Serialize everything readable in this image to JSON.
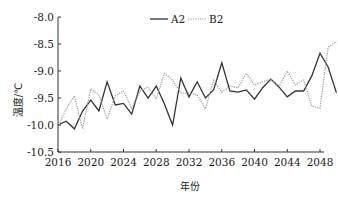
{
  "chart_data": {
    "type": "line",
    "title": "",
    "xlabel": "年份",
    "ylabel": "温度/℃",
    "ylim": [
      -10.5,
      -8.0
    ],
    "xlim": [
      2016,
      2050
    ],
    "yticks": [
      -10.5,
      -10.0,
      -9.5,
      -9.0,
      -8.5,
      -8.0
    ],
    "ytick_labels": [
      "-10.5",
      "-10.0",
      "-9.5",
      "-9.0",
      "-8.5",
      "-8.0"
    ],
    "xticks": [
      2016,
      2020,
      2024,
      2028,
      2032,
      2036,
      2040,
      2044,
      2048
    ],
    "xtick_labels": [
      "2016",
      "2020",
      "2024",
      "2028",
      "2032",
      "2036",
      "2040",
      "2044",
      "2048"
    ],
    "grid": false,
    "legend_position": "top-center",
    "x": [
      2016,
      2017,
      2018,
      2019,
      2020,
      2021,
      2022,
      2023,
      2024,
      2025,
      2026,
      2027,
      2028,
      2029,
      2030,
      2031,
      2032,
      2033,
      2034,
      2035,
      2036,
      2037,
      2038,
      2039,
      2040,
      2041,
      2042,
      2043,
      2044,
      2045,
      2046,
      2047,
      2048,
      2049,
      2050
    ],
    "series": [
      {
        "name": "A2",
        "style": "solid",
        "color": "#333333",
        "values": [
          -10.0,
          -9.93,
          -10.07,
          -9.74,
          -9.54,
          -9.74,
          -9.2,
          -9.63,
          -9.6,
          -9.8,
          -9.28,
          -9.5,
          -9.28,
          -9.61,
          -10.0,
          -9.13,
          -9.48,
          -9.2,
          -9.5,
          -9.35,
          -8.85,
          -9.37,
          -9.39,
          -9.35,
          -9.52,
          -9.31,
          -9.15,
          -9.3,
          -9.48,
          -9.37,
          -9.37,
          -9.09,
          -8.67,
          -8.93,
          -9.4
        ]
      },
      {
        "name": "B2",
        "style": "dotted",
        "color": "#999999",
        "values": [
          -10.04,
          -9.7,
          -9.46,
          -10.07,
          -9.33,
          -9.44,
          -9.89,
          -9.46,
          -9.37,
          -9.69,
          -9.37,
          -9.3,
          -9.52,
          -9.04,
          -9.17,
          -9.41,
          -9.41,
          -9.44,
          -9.7,
          -9.17,
          -9.39,
          -9.28,
          -9.31,
          -9.04,
          -9.26,
          -9.2,
          -9.15,
          -9.28,
          -9.0,
          -9.26,
          -9.17,
          -9.65,
          -9.69,
          -8.56,
          -8.45
        ]
      }
    ]
  },
  "legend": {
    "items": [
      {
        "label": "A2",
        "style": "solid"
      },
      {
        "label": "B2",
        "style": "dotted"
      }
    ]
  },
  "axes": {
    "xlabel": "年份",
    "ylabel": "温度/℃"
  }
}
